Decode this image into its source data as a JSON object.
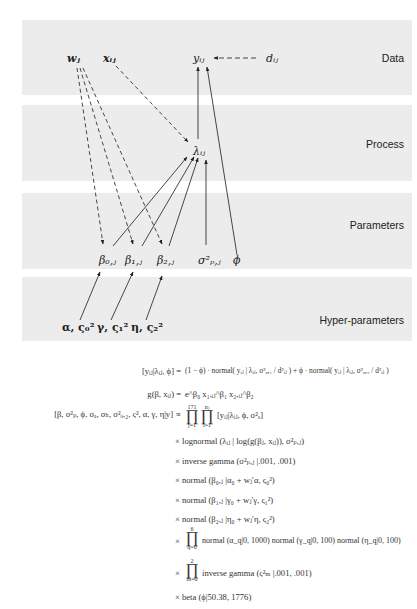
{
  "bands": [
    {
      "name": "data",
      "label": "Data"
    },
    {
      "name": "process",
      "label": "Process"
    },
    {
      "name": "parameters",
      "label": "Parameters"
    },
    {
      "name": "hyper-parameters",
      "label": "Hyper-parameters"
    }
  ],
  "nodes": {
    "w": "wⱼ",
    "x": "xᵢⱼ",
    "y": "yᵢⱼ",
    "d": "dᵢⱼ",
    "lambda": "λᵢⱼ",
    "beta0": "β₀,ⱼ",
    "beta1": "β₁,ⱼ",
    "beta2": "β₂,ⱼ",
    "sigma": "σ²ₚ,ⱼ",
    "phi": "ϕ",
    "hyper0": "α, ς₀²",
    "hyper1": "γ, ς₁²",
    "hyper2": "η, ς₂²"
  },
  "equations": {
    "likelihood": {
      "lhs": "[yᵢⱼ|λᵢⱼ, ϕ] =",
      "rhs": "(1 − ϕ) · normal( yᵢⱼ | λᵢⱼ, σ²ₒ,₁ / d²ᵢⱼ ) + ϕ · normal( yᵢⱼ | λᵢⱼ, σ²ₒ,₂ / d²ᵢⱼ )"
    },
    "process_model": {
      "lhs": "g(β, xᵢⱼ) =",
      "rhs": "e^β₀ x₁,ᵢⱼ^β₁ x₂,ᵢⱼ^β₂"
    },
    "posterior": {
      "lhs": "[β, σ²ₚ, ϕ, σₐ, σₕ, σ²ₒ,₂, ς², α, γ, η|y] ∝",
      "prod_outer_top": "171",
      "prod_outer_bottom": "j=1",
      "prod_inner_top": "nⱼ",
      "prod_inner_bottom": "i=1",
      "rhs": "[yᵢⱼ|λᵢⱼ, ϕ, σ²ₒ]"
    },
    "terms": [
      "× lognormal (λᵢⱼ | log(g(βⱼ, xᵢⱼ)), σ²ₚ,ⱼ)",
      "× inverse gamma (σ²ₚ,ⱼ |.001, .001)",
      "× normal (β₀,ⱼ |α₀ + wⱼ′α, ς₀²)",
      "× normal (β₁,ⱼ |γ₀ + wⱼ′γ, ς₁²)",
      "× normal (β₂,ⱼ |η₀ + wⱼ′η, ς₂²)"
    ],
    "prod_q": {
      "top": "6",
      "bottom": "q=0",
      "text": "normal (α_q|0, 1000) normal (γ_q|0, 100) normal (η_q|0, 100)"
    },
    "prod_m": {
      "top": "2",
      "bottom": "m=0",
      "text": "inverse gamma (ς²ₘ |.001, .001)"
    },
    "beta_term": "× beta (ϕ|50.38, 1776)",
    "times": "×",
    "prod_symbol": "∏"
  }
}
